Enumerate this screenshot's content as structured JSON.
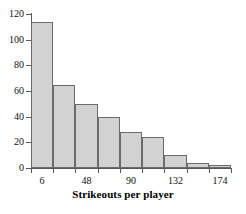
{
  "chart_data": {
    "type": "bar",
    "title": "",
    "xlabel": "Strikeouts per player",
    "ylabel": "",
    "categories": [
      "0-21",
      "21-42",
      "42-63",
      "63-84",
      "84-105",
      "105-126",
      "126-147",
      "147-168",
      "168-189"
    ],
    "values": [
      114,
      65,
      50,
      40,
      28,
      24,
      10,
      4,
      2
    ],
    "bin_edges": [
      0,
      21,
      42,
      63,
      84,
      105,
      126,
      147,
      168,
      189
    ],
    "bin_width": 21,
    "x_tick_labels": [
      "6",
      "48",
      "90",
      "132",
      "174"
    ],
    "x_tick_values": [
      6,
      48,
      90,
      132,
      174
    ],
    "y_tick_labels": [
      "0",
      "20",
      "40",
      "60",
      "80",
      "100",
      "120"
    ],
    "y_tick_values": [
      0,
      20,
      40,
      60,
      80,
      100,
      120
    ],
    "ylim": [
      0,
      120
    ],
    "xlim": [
      0,
      189
    ],
    "grid": false,
    "legend": false,
    "bar_fill_color": "#d2d2d2",
    "bar_edge_color": "#6b6b6b",
    "axis_color": "#595959"
  }
}
